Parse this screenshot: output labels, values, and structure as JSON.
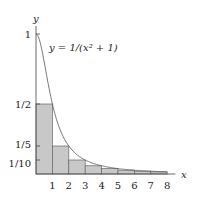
{
  "chart_data": {
    "type": "bar",
    "title": "",
    "xlabel": "x",
    "ylabel": "y",
    "curve_label": "y = 1/(x² + 1)",
    "function": "1/(x^2+1)",
    "categories": [
      "1",
      "2",
      "3",
      "4",
      "5",
      "6",
      "7",
      "8"
    ],
    "values": [
      0.5,
      0.2,
      0.1,
      0.0588,
      0.0385,
      0.027,
      0.02,
      0.0154
    ],
    "bar_note": "Rectangles of width 1 on [k-1,k] with height 1/(k^2+1)",
    "x_ticks": [
      "1",
      "2",
      "3",
      "4",
      "5",
      "6",
      "7",
      "8"
    ],
    "y_ticks": [
      "1",
      "1/2",
      "1/5",
      "1/10"
    ],
    "y_tick_values": [
      1,
      0.5,
      0.2,
      0.1
    ],
    "xlim": [
      0,
      8.5
    ],
    "ylim": [
      0,
      1.1
    ],
    "grid": false,
    "legend": false
  },
  "colors": {
    "bar_fill": "#c8c8c8",
    "bar_stroke": "#666666",
    "axis": "#444444",
    "curve": "#555555"
  }
}
